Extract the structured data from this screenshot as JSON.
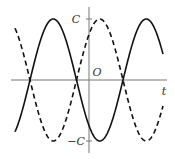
{
  "chart_data": {
    "type": "line",
    "title": "",
    "xlabel": "t",
    "ylabel": "",
    "origin_label": "O",
    "y_ticks": [
      {
        "label": "C",
        "value": 1
      },
      {
        "label": "−C",
        "value": -1
      }
    ],
    "ylim": [
      -1.2,
      1.2
    ],
    "grid": false,
    "legend": null,
    "series": [
      {
        "name": "solid curve",
        "style": "solid",
        "function": "C*sin(omega*(t - t0))",
        "description": "sinusoid of amplitude C; negative at t=0 (approx -0.75C), trough just right of origin",
        "x": [
          -1.6,
          -1.25,
          -0.5,
          0.0,
          0.25,
          0.75,
          1.25,
          1.55
        ],
        "values": [
          -0.85,
          0.0,
          1.0,
          -0.75,
          -1.0,
          0.0,
          1.0,
          0.45
        ]
      },
      {
        "name": "dashed curve",
        "style": "dashed",
        "function": "-C*sin(omega*(t - t0))",
        "description": "mirror image of the solid curve; positive at t=0 (approx 0.75C), peak just right of origin",
        "x": [
          -1.6,
          -1.25,
          -0.5,
          0.0,
          0.25,
          0.75,
          1.25,
          1.55
        ],
        "values": [
          0.85,
          0.0,
          -1.0,
          0.75,
          1.0,
          0.0,
          -1.0,
          -0.45
        ]
      }
    ],
    "colors": {
      "axis": "#777777",
      "curve": "#111111",
      "text": "#333333"
    }
  },
  "labels": {
    "c_top": "C",
    "c_bottom": "−C",
    "origin": "O",
    "t_axis": "t"
  }
}
